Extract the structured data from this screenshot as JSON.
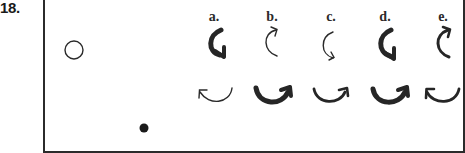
{
  "question": {
    "number": "18."
  },
  "scene": {
    "open_circle": {
      "cx": 74,
      "cy": 50,
      "r": 9
    },
    "filled_dot": {
      "cx": 144,
      "cy": 128,
      "r": 4.5
    }
  },
  "options": [
    {
      "label": "a.",
      "x": 214,
      "top_arrow": {
        "weight": "thick",
        "head": "bottom"
      },
      "bottom_arrow": {
        "weight": "thin",
        "head": "left"
      }
    },
    {
      "label": "b.",
      "x": 272,
      "top_arrow": {
        "weight": "thin",
        "head": "top"
      },
      "bottom_arrow": {
        "weight": "thick",
        "head": "right"
      }
    },
    {
      "label": "c.",
      "x": 331,
      "top_arrow": {
        "weight": "thin",
        "head": "bottom"
      },
      "bottom_arrow": {
        "weight": "medium",
        "head": "right"
      }
    },
    {
      "label": "d.",
      "x": 385,
      "top_arrow": {
        "weight": "thick",
        "head": "bottom"
      },
      "bottom_arrow": {
        "weight": "thick",
        "head": "right"
      }
    },
    {
      "label": "e.",
      "x": 443,
      "top_arrow": {
        "weight": "medium",
        "head": "top"
      },
      "bottom_arrow": {
        "weight": "medium",
        "head": "left"
      }
    }
  ],
  "colors": {
    "ink": "#2a2a2a",
    "background": "#ffffff"
  }
}
